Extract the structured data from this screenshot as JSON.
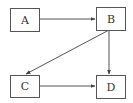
{
  "diagram": {
    "type": "directed-graph",
    "nodes": [
      {
        "id": "A",
        "label": "A"
      },
      {
        "id": "B",
        "label": "B"
      },
      {
        "id": "C",
        "label": "C"
      },
      {
        "id": "D",
        "label": "D"
      }
    ],
    "edges": [
      {
        "from": "A",
        "to": "B"
      },
      {
        "from": "B",
        "to": "C"
      },
      {
        "from": "B",
        "to": "D"
      },
      {
        "from": "C",
        "to": "D"
      }
    ]
  }
}
